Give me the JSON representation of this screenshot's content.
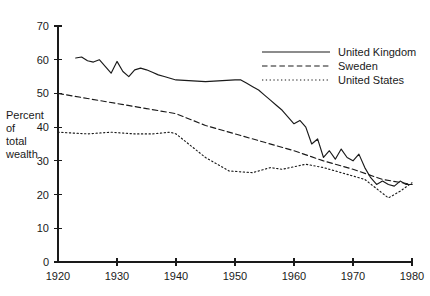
{
  "chart_data": {
    "type": "line",
    "title": "",
    "xlabel": "",
    "ylabel": "Percent of total wealth",
    "ylabel_lines": [
      "Percent",
      "of",
      "total",
      "wealth"
    ],
    "xlim": [
      1920,
      1980
    ],
    "ylim": [
      0,
      70
    ],
    "ytick_values": [
      0,
      10,
      20,
      30,
      40,
      50,
      60,
      70
    ],
    "ytick_labels": [
      "0",
      "10",
      "20",
      "30",
      "40",
      "50",
      "60",
      "70"
    ],
    "xtick_values": [
      1920,
      1930,
      1940,
      1950,
      1960,
      1970,
      1980
    ],
    "xtick_labels": [
      "1920",
      "1930",
      "1940",
      "1950",
      "1960",
      "1970",
      "1980"
    ],
    "grid": false,
    "legend_position": "upper right",
    "series": [
      {
        "name": "United Kingdom",
        "style": "solid",
        "color": "#1a1a1a",
        "x": [
          1923,
          1924,
          1925,
          1926,
          1927,
          1928,
          1929,
          1930,
          1931,
          1932,
          1933,
          1934,
          1935,
          1936,
          1937,
          1938,
          1939,
          1940,
          1945,
          1950,
          1951,
          1952,
          1953,
          1954,
          1955,
          1956,
          1957,
          1958,
          1959,
          1960,
          1961,
          1962,
          1963,
          1964,
          1965,
          1966,
          1967,
          1968,
          1969,
          1970,
          1971,
          1972,
          1973,
          1974,
          1975,
          1976,
          1977,
          1978,
          1979,
          1980
        ],
        "values": [
          60.5,
          60.8,
          59.7,
          59.3,
          60.0,
          58.0,
          56.0,
          59.5,
          56.5,
          55.0,
          57.0,
          57.5,
          57.0,
          56.3,
          55.5,
          55.0,
          54.5,
          54.0,
          53.5,
          54.0,
          54.0,
          53.0,
          52.0,
          51.0,
          49.5,
          48.0,
          46.5,
          45.0,
          43.0,
          41.0,
          42.0,
          40.0,
          35.0,
          36.5,
          31.0,
          33.0,
          30.5,
          33.5,
          31.0,
          30.0,
          32.0,
          28.0,
          25.0,
          23.0,
          24.0,
          23.0,
          22.5,
          24.0,
          23.0,
          23.0
        ]
      },
      {
        "name": "Sweden",
        "style": "dashed",
        "color": "#1a1a1a",
        "x": [
          1920,
          1925,
          1930,
          1935,
          1940,
          1945,
          1950,
          1955,
          1960,
          1965,
          1970,
          1975,
          1980
        ],
        "values": [
          50.0,
          48.5,
          47.0,
          45.5,
          44.0,
          40.5,
          38.0,
          35.5,
          33.0,
          30.0,
          27.5,
          24.5,
          23.0
        ]
      },
      {
        "name": "United States",
        "style": "dotted",
        "color": "#1a1a1a",
        "x": [
          1920,
          1925,
          1929,
          1933,
          1936,
          1939,
          1940,
          1945,
          1949,
          1953,
          1956,
          1958,
          1962,
          1965,
          1969,
          1972,
          1976,
          1978,
          1980
        ],
        "values": [
          38.5,
          38.0,
          38.5,
          38.0,
          38.0,
          38.5,
          38.0,
          31.0,
          27.0,
          26.5,
          28.0,
          27.5,
          29.0,
          28.0,
          26.0,
          24.5,
          19.0,
          21.0,
          23.5
        ]
      }
    ],
    "legend_entries": [
      {
        "label": "United Kingdom",
        "style": "solid"
      },
      {
        "label": "Sweden",
        "style": "dashed"
      },
      {
        "label": "United States",
        "style": "dotted"
      }
    ]
  }
}
